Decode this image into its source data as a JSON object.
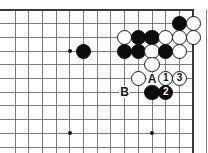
{
  "figure": {
    "kind": "go-board-diagram",
    "width_px": 208,
    "height_px": 153
  },
  "board": {
    "line_color": "#6e6e73",
    "edge_color": "#3a3a3c",
    "background_color": "#ffffff",
    "grid_spacing_px": 13.7,
    "origin_x_px": 15,
    "origin_y_px": 10,
    "columns": 14,
    "rows": 11,
    "edges_visible": {
      "top": true,
      "right": true,
      "left": false,
      "bottom": false
    },
    "star_points": [
      {
        "col": 4,
        "row": 3
      },
      {
        "col": 4,
        "row": 9
      },
      {
        "col": 10,
        "row": 9
      }
    ]
  },
  "stones": [
    {
      "color": "black",
      "col": 5,
      "row": 3,
      "label": ""
    },
    {
      "color": "black",
      "col": 12,
      "row": 1,
      "label": ""
    },
    {
      "color": "white",
      "col": 13,
      "row": 1,
      "label": ""
    },
    {
      "color": "white",
      "col": 8,
      "row": 2,
      "label": ""
    },
    {
      "color": "black",
      "col": 9,
      "row": 2,
      "label": ""
    },
    {
      "color": "black",
      "col": 10,
      "row": 2,
      "label": ""
    },
    {
      "color": "white",
      "col": 11,
      "row": 2,
      "label": ""
    },
    {
      "color": "white",
      "col": 12,
      "row": 2,
      "label": ""
    },
    {
      "color": "white",
      "col": 13,
      "row": 2,
      "label": ""
    },
    {
      "color": "black",
      "col": 8,
      "row": 3,
      "label": ""
    },
    {
      "color": "black",
      "col": 9,
      "row": 3,
      "label": ""
    },
    {
      "color": "white",
      "col": 10,
      "row": 3,
      "label": ""
    },
    {
      "color": "black",
      "col": 11,
      "row": 3,
      "label": ""
    },
    {
      "color": "white",
      "col": 12,
      "row": 3,
      "label": ""
    },
    {
      "color": "white",
      "col": 10,
      "row": 4,
      "label": ""
    },
    {
      "color": "white",
      "col": 9,
      "row": 5,
      "label": ""
    },
    {
      "color": "white",
      "col": 11,
      "row": 5,
      "label": "1"
    },
    {
      "color": "white",
      "col": 12,
      "row": 5,
      "label": "3"
    },
    {
      "color": "black",
      "col": 10,
      "row": 6,
      "label": ""
    },
    {
      "color": "black",
      "col": 11,
      "row": 6,
      "label": "2"
    }
  ],
  "point_labels": [
    {
      "text": "A",
      "col": 10,
      "row": 5
    },
    {
      "text": "B",
      "col": 8,
      "row": 6
    }
  ],
  "legend": {
    "move_1": "1",
    "move_2": "2",
    "move_3": "3",
    "point_a": "A",
    "point_b": "B"
  },
  "colors": {
    "black_stone": "#0d0d0d",
    "white_stone": "#ffffff",
    "stone_outline": "#1a1a1a",
    "grid": "#6e6e73",
    "board_edge": "#3a3a3c",
    "label_text": "#1a1a1a"
  }
}
